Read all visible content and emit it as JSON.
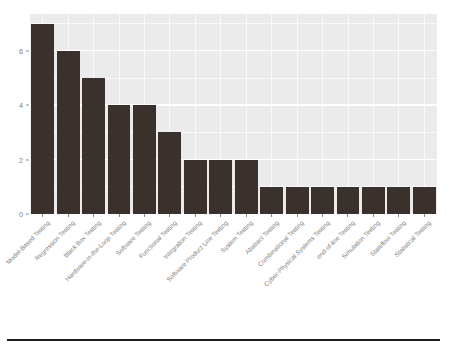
{
  "chart_data": {
    "type": "bar",
    "title": "",
    "subtitle": "",
    "xlabel": "",
    "ylabel": "",
    "categories": [
      "Model-Based Testing",
      "Regression Testing",
      "Black Box Testing",
      "Hardware-in-the-Loop Testing",
      "Software Testing",
      "Functional Testing",
      "Integration Testing",
      "Software Product Line Testing",
      "System Testing",
      "Abstract Testing",
      "Combinational Testing",
      "Cyber-Physical Systems Testing",
      "end-of-line Testing",
      "Simulation Testing",
      "Stateflow Testing",
      "Statistical Testing"
    ],
    "values": [
      7,
      6,
      5,
      4,
      4,
      3,
      2,
      2,
      2,
      1,
      1,
      1,
      1,
      1,
      1,
      1
    ],
    "ylim": [
      0,
      7.35
    ],
    "y_ticks": [
      0,
      2,
      4,
      6
    ],
    "y_tick_labels": [
      "0",
      "2",
      "4",
      "6"
    ],
    "y_minor_ticks": [
      1,
      3,
      5,
      7
    ],
    "grid": true,
    "legend": null,
    "legend_position": "none",
    "bar_color": "#3b312c",
    "panel_background": "#ebebeb",
    "gridline_color": "#ffffff",
    "axis_text_color": "#7f7f7f",
    "x_label_rotation": -45,
    "figure_background": "#ffffff"
  },
  "annotations": {
    "bottom_rule_color": "#231d1b"
  }
}
